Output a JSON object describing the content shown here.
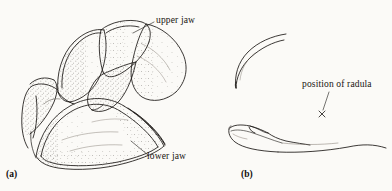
{
  "figure": {
    "background_color": "#fbfaf7",
    "ink_color": "#1a1714",
    "panels": [
      {
        "tag": "(a)",
        "description": "three-quarter view of articulated cephalopod beak",
        "labels": [
          {
            "text": "upper jaw",
            "leader": true
          },
          {
            "text": "lower jaw",
            "leader": true
          }
        ]
      },
      {
        "tag": "(b)",
        "description": "separated upper and lower beaks in lateral profile",
        "labels": [
          {
            "text": "position of radula",
            "leader": true,
            "marker": "x"
          }
        ]
      }
    ]
  },
  "labels": {
    "upper_jaw": "upper jaw",
    "lower_jaw": "lower jaw",
    "position_of_radula": "position of radula"
  },
  "panel_tags": {
    "a": "(a)",
    "b": "(b)"
  },
  "markers": {
    "radula_cross": "×"
  }
}
